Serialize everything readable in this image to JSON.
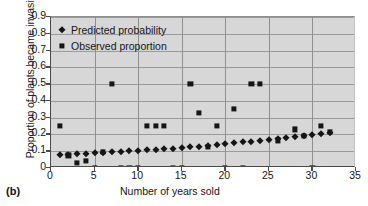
{
  "panel_label": "(b)",
  "legend": {
    "position": "top-left-inside",
    "items": [
      {
        "label": "Predicted probability",
        "marker": "diamond",
        "color": "#151515"
      },
      {
        "label": "Observed proportion",
        "marker": "square",
        "color": "#151515"
      }
    ]
  },
  "axes": {
    "ylabel": "Proportion of plants became invasive",
    "xlabel": "Number of years sold",
    "yticks": [
      "0",
      "0.1",
      "0.2",
      "0.3",
      "0.4",
      "0.5",
      "0.6",
      "0.7",
      "0.8",
      "0.9"
    ],
    "xticks": [
      "0",
      "5",
      "10",
      "15",
      "20",
      "25",
      "30",
      "35"
    ],
    "ylim": [
      0,
      0.9
    ],
    "xlim": [
      0,
      35
    ],
    "grid": true,
    "plot_bg": "#d7d7d7",
    "grid_color": "#9a9a9a",
    "axis_color": "#4a4a4a"
  },
  "chart_data": {
    "type": "scatter",
    "title": "",
    "xlabel": "Number of years sold",
    "ylabel": "Proportion of plants became invasive",
    "xlim": [
      0,
      35
    ],
    "ylim": [
      0,
      0.9
    ],
    "grid": true,
    "legend_position": "upper left",
    "series": [
      {
        "name": "Predicted probability",
        "marker": "diamond",
        "color": "#151515",
        "points": [
          {
            "x": 1,
            "y": 0.075
          },
          {
            "x": 2,
            "y": 0.078
          },
          {
            "x": 3,
            "y": 0.082
          },
          {
            "x": 4,
            "y": 0.085
          },
          {
            "x": 5,
            "y": 0.088
          },
          {
            "x": 6,
            "y": 0.092
          },
          {
            "x": 7,
            "y": 0.095
          },
          {
            "x": 8,
            "y": 0.098
          },
          {
            "x": 9,
            "y": 0.1
          },
          {
            "x": 10,
            "y": 0.103
          },
          {
            "x": 11,
            "y": 0.106
          },
          {
            "x": 12,
            "y": 0.11
          },
          {
            "x": 13,
            "y": 0.112
          },
          {
            "x": 14,
            "y": 0.116
          },
          {
            "x": 15,
            "y": 0.12
          },
          {
            "x": 16,
            "y": 0.124
          },
          {
            "x": 17,
            "y": 0.128
          },
          {
            "x": 18,
            "y": 0.133
          },
          {
            "x": 19,
            "y": 0.138
          },
          {
            "x": 20,
            "y": 0.142
          },
          {
            "x": 21,
            "y": 0.147
          },
          {
            "x": 22,
            "y": 0.152
          },
          {
            "x": 23,
            "y": 0.157
          },
          {
            "x": 24,
            "y": 0.162
          },
          {
            "x": 25,
            "y": 0.168
          },
          {
            "x": 26,
            "y": 0.175
          },
          {
            "x": 27,
            "y": 0.18
          },
          {
            "x": 28,
            "y": 0.186
          },
          {
            "x": 29,
            "y": 0.192
          },
          {
            "x": 30,
            "y": 0.198
          },
          {
            "x": 31,
            "y": 0.205
          },
          {
            "x": 32,
            "y": 0.21
          }
        ]
      },
      {
        "name": "Observed proportion",
        "marker": "square",
        "color": "#151515",
        "points": [
          {
            "x": 1,
            "y": 0.25
          },
          {
            "x": 2,
            "y": 0.075
          },
          {
            "x": 3,
            "y": 0.03
          },
          {
            "x": 4,
            "y": 0.04
          },
          {
            "x": 5,
            "y": 0.0
          },
          {
            "x": 6,
            "y": 0.095
          },
          {
            "x": 7,
            "y": 0.5
          },
          {
            "x": 8,
            "y": 0.0
          },
          {
            "x": 9,
            "y": 0.0
          },
          {
            "x": 10,
            "y": 0.0
          },
          {
            "x": 11,
            "y": 0.25
          },
          {
            "x": 12,
            "y": 0.25
          },
          {
            "x": 13,
            "y": 0.25
          },
          {
            "x": 14,
            "y": 0.0
          },
          {
            "x": 15,
            "y": 0.0
          },
          {
            "x": 16,
            "y": 0.5
          },
          {
            "x": 17,
            "y": 0.33
          },
          {
            "x": 18,
            "y": 0.125
          },
          {
            "x": 19,
            "y": 0.25
          },
          {
            "x": 20,
            "y": 0.0
          },
          {
            "x": 21,
            "y": 0.35
          },
          {
            "x": 22,
            "y": 0.0
          },
          {
            "x": 23,
            "y": 0.5
          },
          {
            "x": 24,
            "y": 0.5
          },
          {
            "x": 26,
            "y": 0.165
          },
          {
            "x": 28,
            "y": 0.23
          },
          {
            "x": 29,
            "y": 0.19
          },
          {
            "x": 30,
            "y": 0.0
          },
          {
            "x": 31,
            "y": 0.25
          },
          {
            "x": 32,
            "y": 0.215
          }
        ]
      }
    ]
  }
}
